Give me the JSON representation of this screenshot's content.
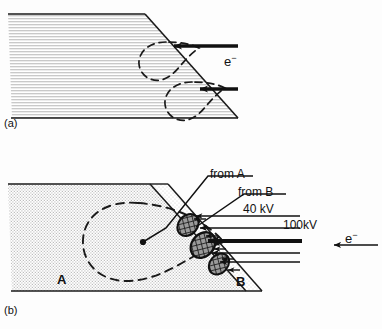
{
  "figure": {
    "panels": [
      {
        "id": "a",
        "label": "(a)",
        "description": "Homogeneous specimen with inclined surface; two pear-shaped electron interaction volumes centred where the electron beams strike the tilted surface.",
        "beams": [
          {
            "name": "electron-beam-upper",
            "label": "e-",
            "kv": null,
            "weight": "thin"
          },
          {
            "name": "electron-beam-lower",
            "label": "e-",
            "kv": null,
            "weight": "thin"
          }
        ],
        "beam_label": "e",
        "beam_label_sup": "−",
        "interaction_volumes": 2
      },
      {
        "id": "b",
        "label": "(b)",
        "description": "Layered specimen: bulk region A and thin inclined surface layer B. Electron beams at 40 kV and 100 kV generate X-rays in the dark cross-hatched excitation zones within layer B; the large dashed contour is the interaction volume in A.",
        "regions": [
          {
            "name": "region-a",
            "label": "A",
            "fill": "light-stipple"
          },
          {
            "name": "region-b",
            "label": "B",
            "fill": "light-stipple-band"
          }
        ],
        "callouts": [
          {
            "name": "callout-from-a",
            "label": "from A",
            "underline": true
          },
          {
            "name": "callout-from-b",
            "label": "from B",
            "underline": true
          }
        ],
        "beams": [
          {
            "name": "beam-40kv",
            "label": "40 kV",
            "weight": "thin"
          },
          {
            "name": "beam-100kv",
            "label": "100kV",
            "weight": "thick"
          }
        ],
        "beam_label": "e",
        "beam_label_sup": "−",
        "excitation_zones": 3
      }
    ],
    "labels": {
      "panel_a": "(a)",
      "panel_b": "(b)",
      "region_a": "A",
      "region_b": "B",
      "from_a": "from A",
      "from_b": "from B",
      "kv_40": "40 kV",
      "kv_100": "100kV",
      "electron_a": "e",
      "electron_b": "e",
      "electron_sup": "−"
    },
    "colors": {
      "ink": "#111111",
      "line": "#1a1a1a",
      "specimen_fill": "#d9d9d9",
      "specimen_fill_light": "#e4e4e4",
      "layer_fill": "#e9e9e9",
      "excitation_fill": "#4a4a4a",
      "background": "#fdfdfd"
    }
  }
}
